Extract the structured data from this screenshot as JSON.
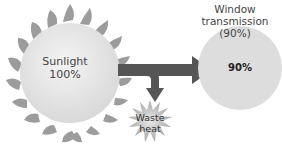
{
  "diagram": {
    "sun": {
      "label_line1": "Sunlight",
      "label_line2": "100%",
      "fill": "#e6e6e6",
      "ray_color": "#9a9a9a"
    },
    "window_transmission": {
      "line1": "Window",
      "line2": "transmission",
      "line3": "(90%)"
    },
    "result_circle": {
      "label": "90%",
      "fill": "#dcdcdc"
    },
    "waste_heat": {
      "line1": "Waste",
      "line2": "heat",
      "fill": "#c8c8c8"
    },
    "arrows": {
      "color": "#555555"
    }
  }
}
